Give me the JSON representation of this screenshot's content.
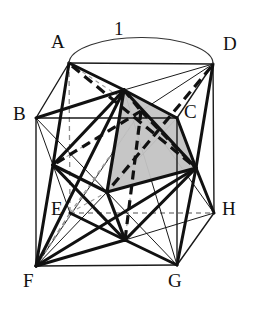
{
  "figure": {
    "background_color": "#ffffff",
    "stroke_color": "#111111",
    "hidden_stroke_color": "#777777",
    "shade_fill": "#c0c0c0",
    "shade_stroke": "#111111"
  },
  "dimension": {
    "label": "1",
    "x": 118,
    "y": 28,
    "arc": {
      "from_x": 69,
      "from_y": 63,
      "to_x": 213,
      "to_y": 64,
      "rx": 72,
      "ry": 26
    }
  },
  "vertices": [
    {
      "id": "A",
      "label": "A",
      "x": 69,
      "y": 63,
      "label_x": 51,
      "label_y": 38,
      "face": "top"
    },
    {
      "id": "B",
      "label": "B",
      "x": 36,
      "y": 118,
      "label_x": 14,
      "label_y": 108,
      "face": "top"
    },
    {
      "id": "C",
      "label": "C",
      "x": 177,
      "y": 118,
      "label_x": 185,
      "label_y": 106,
      "face": "top"
    },
    {
      "id": "D",
      "label": "D",
      "x": 213,
      "y": 64,
      "label_x": 224,
      "label_y": 40,
      "face": "top"
    },
    {
      "id": "E",
      "label": "E",
      "x": 70,
      "y": 213,
      "label_x": 50,
      "label_y": 203,
      "face": "bottom"
    },
    {
      "id": "F",
      "label": "F",
      "x": 36,
      "y": 266,
      "label_x": 22,
      "label_y": 272,
      "face": "bottom"
    },
    {
      "id": "G",
      "label": "G",
      "x": 177,
      "y": 265,
      "label_x": 168,
      "label_y": 272,
      "face": "bottom"
    },
    {
      "id": "H",
      "label": "H",
      "x": 214,
      "y": 213,
      "label_x": 223,
      "label_y": 203,
      "face": "bottom"
    }
  ],
  "face_centers": [
    {
      "id": "T",
      "name": "top-face-center",
      "x": 124,
      "y": 90
    },
    {
      "id": "N",
      "name": "bottom-face-center",
      "x": 125,
      "y": 240
    },
    {
      "id": "P",
      "name": "front-face-center",
      "x": 107,
      "y": 192
    },
    {
      "id": "Q",
      "name": "back-face-center",
      "x": 141,
      "y": 111
    },
    {
      "id": "L",
      "name": "left-face-center",
      "x": 53,
      "y": 165
    },
    {
      "id": "R",
      "name": "right-face-center",
      "x": 196,
      "y": 168
    }
  ],
  "cube_edges_visible": [
    {
      "from": "A",
      "to": "D"
    },
    {
      "from": "A",
      "to": "B"
    },
    {
      "from": "B",
      "to": "C"
    },
    {
      "from": "C",
      "to": "D"
    },
    {
      "from": "B",
      "to": "F"
    },
    {
      "from": "C",
      "to": "G"
    },
    {
      "from": "D",
      "to": "H"
    },
    {
      "from": "F",
      "to": "G"
    },
    {
      "from": "G",
      "to": "H"
    },
    {
      "from": "E",
      "to": "F"
    },
    {
      "from": "E",
      "to": "H"
    },
    {
      "from": "A",
      "to": "E"
    }
  ],
  "cube_edges_hidden": [
    {
      "from": "A",
      "to": "E"
    },
    {
      "from": "E",
      "to": "H"
    },
    {
      "from": "E",
      "to": "F"
    }
  ],
  "octa_edges_solid": [
    {
      "from": "T",
      "to": "P"
    },
    {
      "from": "T",
      "to": "L"
    },
    {
      "from": "T",
      "to": "R"
    },
    {
      "from": "P",
      "to": "L"
    },
    {
      "from": "P",
      "to": "R"
    },
    {
      "from": "N",
      "to": "P"
    },
    {
      "from": "N",
      "to": "L"
    },
    {
      "from": "N",
      "to": "R"
    }
  ],
  "octa_edges_dashed": [
    {
      "from": "T",
      "to": "Q"
    },
    {
      "from": "Q",
      "to": "L"
    },
    {
      "from": "Q",
      "to": "R"
    },
    {
      "from": "N",
      "to": "Q"
    }
  ],
  "shaded_face": {
    "name": "shaded-octahedron-face",
    "points": "124,90 177,118 196,168 107,192"
  },
  "center_rays_from": [
    {
      "vertex": "A",
      "targets": [
        "T",
        "Q",
        "L"
      ]
    },
    {
      "vertex": "D",
      "targets": [
        "T",
        "Q",
        "R"
      ]
    },
    {
      "vertex": "B",
      "targets": [
        "T",
        "P",
        "L"
      ]
    },
    {
      "vertex": "C",
      "targets": [
        "T",
        "P",
        "R"
      ]
    },
    {
      "vertex": "E",
      "targets": [
        "N",
        "Q",
        "L"
      ]
    },
    {
      "vertex": "H",
      "targets": [
        "N",
        "Q",
        "R"
      ]
    },
    {
      "vertex": "F",
      "targets": [
        "N",
        "P",
        "L"
      ]
    },
    {
      "vertex": "G",
      "targets": [
        "N",
        "P",
        "R"
      ]
    }
  ]
}
